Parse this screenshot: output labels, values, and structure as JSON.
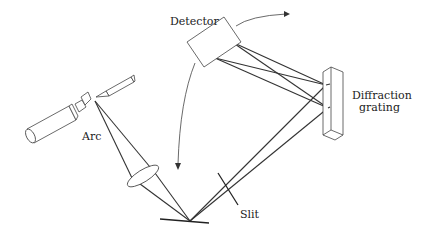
{
  "diagram": {
    "type": "optical-schematic",
    "labels": {
      "detector": "Detector",
      "grating_line1": "Diffraction",
      "grating_line2": "grating",
      "arc": "Arc",
      "slit": "Slit"
    },
    "components": [
      "Detector",
      "Diffraction grating",
      "Arc",
      "Lens",
      "Mirror",
      "Slit"
    ],
    "annotations": [
      "double-headed curved arrow indicating detector rotation"
    ],
    "colors": {
      "line": "#333333",
      "background": "#ffffff"
    }
  }
}
